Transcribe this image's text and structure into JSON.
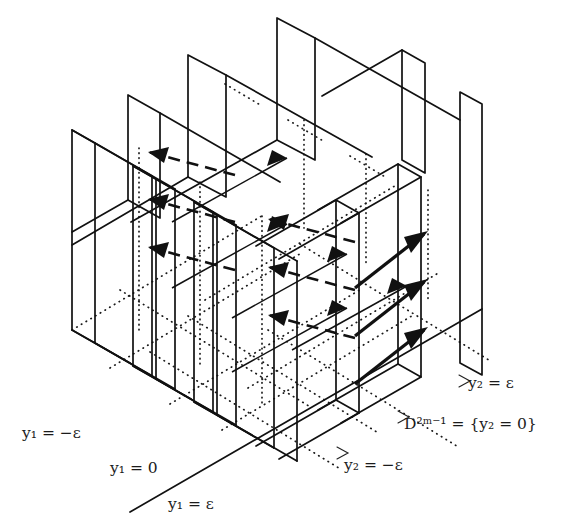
{
  "figure": {
    "background_color": "#ffffff",
    "line_color": "#111111"
  },
  "labels": {
    "y1_neg_eps": {
      "text": "y₁ = −ε",
      "x": 22,
      "y": 438
    },
    "y1_zero": {
      "text": "y₁ = 0",
      "x": 110,
      "y": 473
    },
    "y1_pos_eps": {
      "text": "y₁ = ε",
      "x": 168,
      "y": 509
    },
    "y2_neg_eps": {
      "text": "y₂ = −ε",
      "x": 344,
      "y": 470
    },
    "y2_zero": {
      "text": "D²ᵐ⁻¹ = {y₂ = 0}",
      "x": 404,
      "y": 429
    },
    "y2_pos_eps": {
      "text": "y₂ = ε",
      "x": 468,
      "y": 388
    }
  },
  "label_parts": {
    "y1_neg_eps": {
      "var": "y",
      "sub": "1",
      "rel": " = −",
      "val": "ε"
    },
    "y1_zero": {
      "var": "y",
      "sub": "1",
      "rel": " = ",
      "val": "0"
    },
    "y1_pos_eps": {
      "var": "y",
      "sub": "1",
      "rel": " = ",
      "val": "ε"
    },
    "y2_neg_eps": {
      "var": "y",
      "sub": "2",
      "rel": " = −",
      "val": "ε"
    },
    "y2_zero": {
      "var": "D",
      "sup": "2m−1",
      "rel": " = {",
      "var2": "y",
      "sub2": "2",
      "rel2": " = 0}"
    },
    "y2_pos_eps": {
      "var": "y",
      "sub": "2",
      "rel": " = ",
      "val": "ε"
    }
  },
  "planes": {
    "family_y1": {
      "count": 3,
      "orientation": "front-facing parallelogram panels receding to upper-right",
      "members": [
        "y1 = -ε",
        "y1 = 0",
        "y1 = ε"
      ]
    },
    "family_y2": {
      "count": 3,
      "orientation": "side-facing panels receding to upper-right",
      "members": [
        "y2 = -ε",
        "y2 = 0",
        "y2 = ε"
      ]
    }
  },
  "arrows": {
    "leftward": {
      "count": 6,
      "style": "dashed",
      "direction": "up-left",
      "meaning": "flow toward decreasing y1"
    },
    "rightward_thin": {
      "count": 5,
      "style": "solid-thin",
      "direction": "up-right",
      "meaning": "flow toward increasing y2"
    },
    "rightward_bold": {
      "count": 3,
      "style": "solid-bold",
      "direction": "up-right",
      "meaning": "outgoing flow"
    }
  }
}
